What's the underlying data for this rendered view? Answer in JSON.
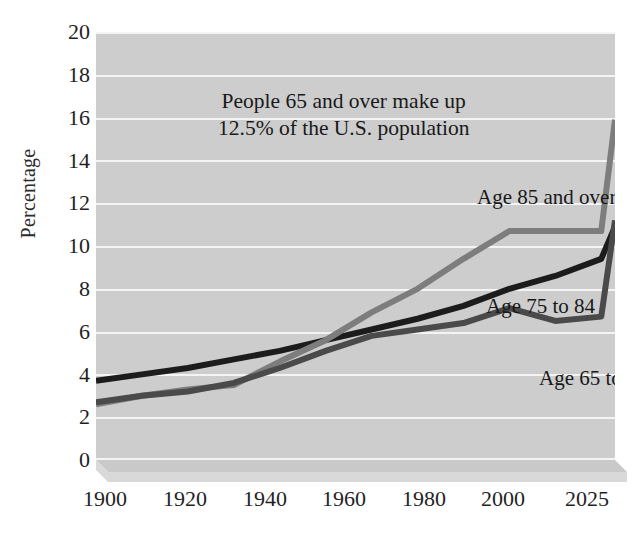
{
  "chart_data": {
    "type": "line",
    "title": "",
    "xlabel": "",
    "ylabel": "Percentage",
    "xlim": [
      1900,
      2025
    ],
    "ylim": [
      0,
      20
    ],
    "ytick_step": 2,
    "grid": true,
    "legend_position": "inline-labels",
    "x_ticks": [
      "1900",
      "1920",
      "1940",
      "1960",
      "1980",
      "2000",
      "2025"
    ],
    "x_tick_values": [
      1900,
      1920,
      1940,
      1960,
      1980,
      2000,
      2025
    ],
    "y_ticks": [
      "0",
      "2",
      "4",
      "6",
      "8",
      "10",
      "12",
      "14",
      "16",
      "18",
      "20"
    ],
    "y_tick_values": [
      0,
      2,
      4,
      6,
      8,
      10,
      12,
      14,
      16,
      18,
      20
    ],
    "x": [
      1900,
      1910,
      1920,
      1930,
      1940,
      1950,
      1960,
      1970,
      1980,
      1990,
      2000,
      2010,
      2025
    ],
    "series": [
      {
        "name": "Age 65 to 74",
        "color": "#1c1c1c",
        "values": [
          3.7,
          4.0,
          4.3,
          4.7,
          5.1,
          5.6,
          6.1,
          6.6,
          7.2,
          8.0,
          8.6,
          9.4,
          10.9
        ]
      },
      {
        "name": "Age 75 to 84",
        "color": "#7d7d7d",
        "values": [
          2.6,
          3.0,
          3.3,
          3.5,
          4.6,
          5.6,
          6.9,
          8.0,
          9.4,
          10.7,
          10.7,
          10.7,
          15.9
        ]
      },
      {
        "name": "Age 85 and over",
        "color": "#4a4a4a",
        "values": [
          2.7,
          3.0,
          3.2,
          3.6,
          4.3,
          5.1,
          5.8,
          6.1,
          6.4,
          7.1,
          6.5,
          6.7,
          11.2
        ]
      }
    ],
    "annotations": [
      {
        "id": "headline",
        "line1": "People 65 and over make up",
        "line2": "12.5% of the U.S. population"
      },
      {
        "id": "label-85",
        "text": "Age 85 and over"
      },
      {
        "id": "label-7584",
        "text": "Age 75 to 84"
      },
      {
        "id": "label-6574",
        "text": "Age 65 to 74"
      }
    ],
    "colors": {
      "plot_background": "#cdcdcd",
      "gridline": "#f4f4f4",
      "page_background": "#ffffff",
      "base_slab_top": "#c4c4c4",
      "base_slab_front": "#d5d5d5",
      "text": "#1f1f1f"
    }
  }
}
